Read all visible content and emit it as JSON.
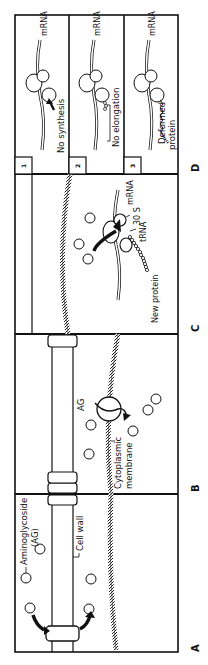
{
  "figure": {
    "orientation": "rotated-90-ccw",
    "colors": {
      "ink": "#111111",
      "background": "#ffffff",
      "membrane": "#555555"
    }
  },
  "panels": [
    {
      "letter": "A",
      "labels": {
        "aminoglycoside": "Aminoglycoside",
        "ag_abbrev": "(AG)",
        "cell_wall": "Cell wall"
      }
    },
    {
      "letter": "B",
      "labels": {
        "ag": "AG",
        "membrane_line1": "Cytoplasmic",
        "membrane_line2": "membrane"
      }
    },
    {
      "letter": "C",
      "labels": {
        "mrna": "mRNA",
        "subunit": "30 S",
        "trna": "tRNA",
        "new_protein": "New protein"
      }
    },
    {
      "letter": "D",
      "subpanels": [
        {
          "number": "1",
          "mrna": "mRNA",
          "caption": "No synthesis"
        },
        {
          "number": "2",
          "mrna": "mRNA",
          "caption": "No elongation"
        },
        {
          "number": "3",
          "mrna": "mRNA",
          "caption_line1": "Deformed",
          "caption_line2": "protein"
        }
      ]
    }
  ]
}
